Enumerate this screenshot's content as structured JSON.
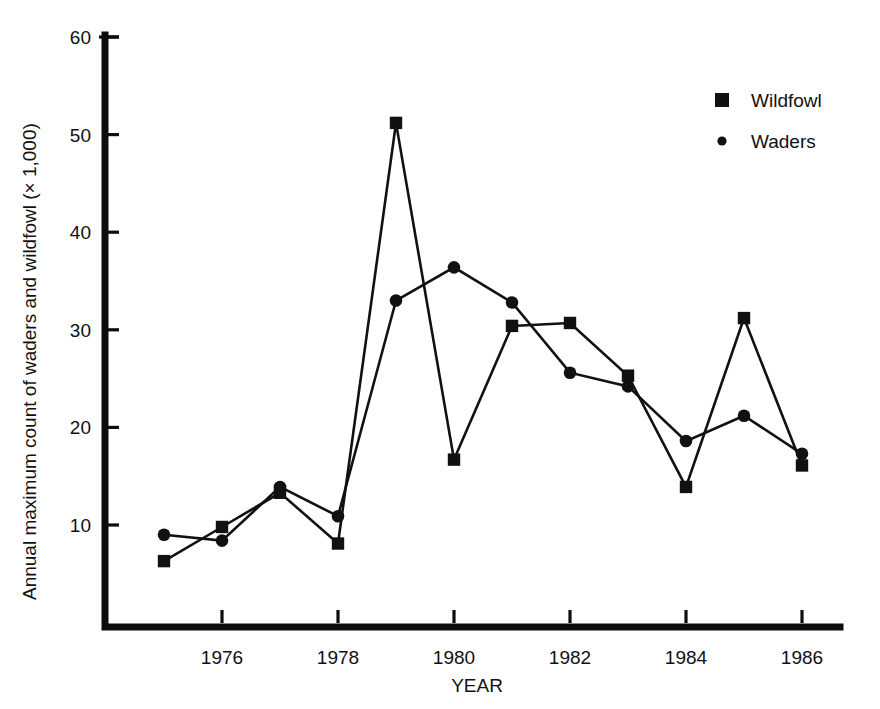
{
  "chart_data": {
    "type": "line",
    "title": "",
    "xlabel": "YEAR",
    "ylabel": "Annual maximum count of waders and wildfowl (× 1,000)",
    "x": [
      1975,
      1976,
      1977,
      1978,
      1979,
      1980,
      1981,
      1982,
      1983,
      1984,
      1985,
      1986
    ],
    "xlim": [
      1974.5,
      1987.0
    ],
    "ylim": [
      0,
      60
    ],
    "xticks": [
      1976,
      1978,
      1980,
      1982,
      1984,
      1986
    ],
    "xtick_labels": [
      "1976",
      "1978",
      "1980",
      "1982",
      "1984",
      "1986"
    ],
    "yticks": [
      10,
      20,
      30,
      40,
      50,
      60
    ],
    "ytick_labels": [
      "10",
      "20",
      "30",
      "40",
      "50",
      "60"
    ],
    "grid": false,
    "legend_position": "top-right",
    "series": [
      {
        "name": "Wildfowl",
        "marker": "square",
        "values": [
          6.3,
          9.8,
          13.3,
          8.1,
          51.2,
          16.7,
          30.4,
          30.7,
          25.3,
          13.9,
          31.2,
          16.1
        ]
      },
      {
        "name": "Waders",
        "marker": "circle",
        "values": [
          9.0,
          8.4,
          13.9,
          10.9,
          33.0,
          36.4,
          32.8,
          25.6,
          24.2,
          18.6,
          21.2,
          17.3
        ]
      }
    ]
  },
  "legend": {
    "items": [
      {
        "label": "Wildfowl",
        "marker": "square"
      },
      {
        "label": "Waders",
        "marker": "circle"
      }
    ]
  },
  "axes": {
    "y_title": "Annual maximum count of waders and wildfowl (× 1,000)",
    "x_title": "YEAR"
  },
  "colors": {
    "ink": "#111111",
    "background": "#ffffff"
  }
}
